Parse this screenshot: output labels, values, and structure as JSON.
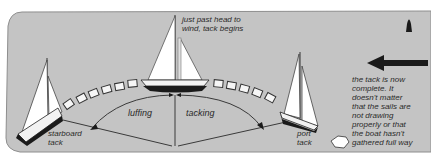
{
  "diagram": {
    "colors": {
      "sea": "#c4c4c4",
      "sail": "#ffffff",
      "hull_dark": "#1a1a1a",
      "line": "#3a3a3a",
      "text": "#2a2a2a"
    },
    "labels": {
      "head_to_wind_line1": "just past head to",
      "head_to_wind_line2": "wind, tack begins",
      "luffing": "luffing",
      "tacking": "tacking",
      "starboard_line1": "starboard",
      "starboard_line2": "tack",
      "port_line1": "port",
      "port_line2": "tack",
      "note": [
        "the tack is now",
        "complete. It",
        "doesn't matter",
        "that the sails are",
        "not drawing",
        "properly or that",
        "the boat hasn't",
        "gathered full way"
      ]
    },
    "icons": {
      "wind_arrow": "wind-direction-arrow-left",
      "buoy": "buoy-marker",
      "wake": "wake-trail-blocks"
    }
  }
}
